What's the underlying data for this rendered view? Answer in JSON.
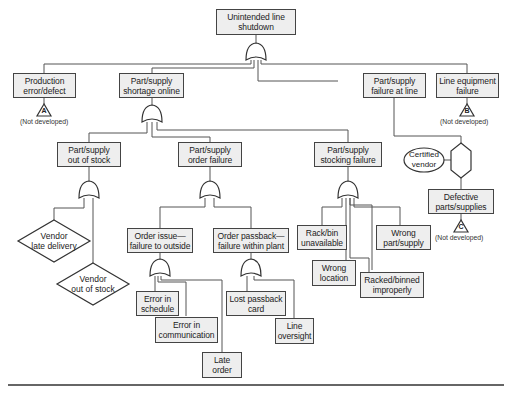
{
  "diagram": {
    "type": "fault-tree",
    "top_event": "Unintended line\nshutdown",
    "nodes": {
      "production_error": "Production\nerror/defect",
      "shortage_online": "Part/supply\nshortage online",
      "failure_at_line": "Part/supply\nfailure at line",
      "line_equipment": "Line equipment\nfailure",
      "out_of_stock": "Part/supply\nout of stock",
      "order_failure": "Part/supply\norder failure",
      "stocking_failure": "Part/supply\nstocking failure",
      "vendor_late": "Vendor\nlate delivery",
      "vendor_out": "Vendor\nout of stock",
      "order_issue": "Order issue—\nfailure to outside",
      "order_passback": "Order passback—\nfailure within plant",
      "error_schedule": "Error in\nschedule",
      "error_communication": "Error in\ncommunication",
      "late_order": "Late\norder",
      "lost_passback": "Lost passback\ncard",
      "line_oversight": "Line\noversight",
      "rack_bin": "Rack/bin\nunavailable",
      "wrong_location": "Wrong\nlocation",
      "racked_binned": "Racked/binned\nimproperly",
      "wrong_part": "Wrong\npart/supply",
      "certified_vendor": "Certified\nvendor",
      "defective_parts": "Defective\nparts/supplies"
    },
    "transfers": {
      "a": "A",
      "b": "B",
      "c": "C"
    },
    "not_developed": "(Not developed)",
    "colors": {
      "box_fill": "#eeeeee",
      "line": "#555555",
      "border": "#444444"
    }
  }
}
